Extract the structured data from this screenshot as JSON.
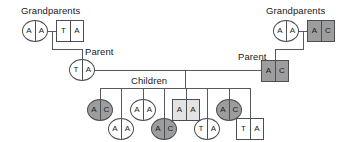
{
  "diagram": {
    "title_labels": {
      "grandparents_left": "Grandparents",
      "grandparents_right": "Grandparents",
      "parent_left": "Parent",
      "parent_right": "Parent",
      "children": "Children"
    },
    "colors": {
      "stroke": "#4a4f53",
      "line": "#555a5e",
      "fill_white": "#ffffff",
      "fill_light_gray": "#e3e3e3",
      "fill_dark_gray": "#9d9d9d",
      "text": "#1a1a1a"
    },
    "generations": [
      {
        "name": "grandparents-left",
        "members": [
          {
            "id": "gp-l-female",
            "shape": "circle",
            "fill": "white",
            "alleles": [
              "A",
              "A"
            ]
          },
          {
            "id": "gp-l-male",
            "shape": "square",
            "fill": "white",
            "alleles": [
              "T",
              "A"
            ]
          }
        ]
      },
      {
        "name": "grandparents-right",
        "members": [
          {
            "id": "gp-r-female",
            "shape": "circle",
            "fill": "white",
            "alleles": [
              "A",
              "A"
            ]
          },
          {
            "id": "gp-r-male",
            "shape": "square",
            "fill": "gray",
            "alleles": [
              "A",
              "C"
            ]
          }
        ]
      },
      {
        "name": "parents",
        "members": [
          {
            "id": "parent-left",
            "shape": "circle",
            "fill": "white",
            "alleles": [
              "T",
              "A"
            ]
          },
          {
            "id": "parent-right",
            "shape": "square",
            "fill": "gray",
            "alleles": [
              "A",
              "C"
            ]
          }
        ]
      },
      {
        "name": "children",
        "members": [
          {
            "id": "child-1",
            "shape": "circle",
            "fill": "gray",
            "alleles": [
              "A",
              "C"
            ]
          },
          {
            "id": "child-2",
            "shape": "circle",
            "fill": "white",
            "alleles": [
              "A",
              "A"
            ]
          },
          {
            "id": "child-3",
            "shape": "circle",
            "fill": "white",
            "alleles": [
              "A",
              "A"
            ]
          },
          {
            "id": "child-4",
            "shape": "circle",
            "fill": "gray",
            "alleles": [
              "A",
              "C"
            ]
          },
          {
            "id": "child-5",
            "shape": "square",
            "fill": "light",
            "alleles": [
              "A",
              "A"
            ]
          },
          {
            "id": "child-6",
            "shape": "circle",
            "fill": "white",
            "alleles": [
              "T",
              "A"
            ]
          },
          {
            "id": "child-7",
            "shape": "circle",
            "fill": "gray",
            "alleles": [
              "A",
              "C"
            ]
          },
          {
            "id": "child-8",
            "shape": "square",
            "fill": "white",
            "alleles": [
              "T",
              "A"
            ]
          }
        ]
      }
    ]
  }
}
